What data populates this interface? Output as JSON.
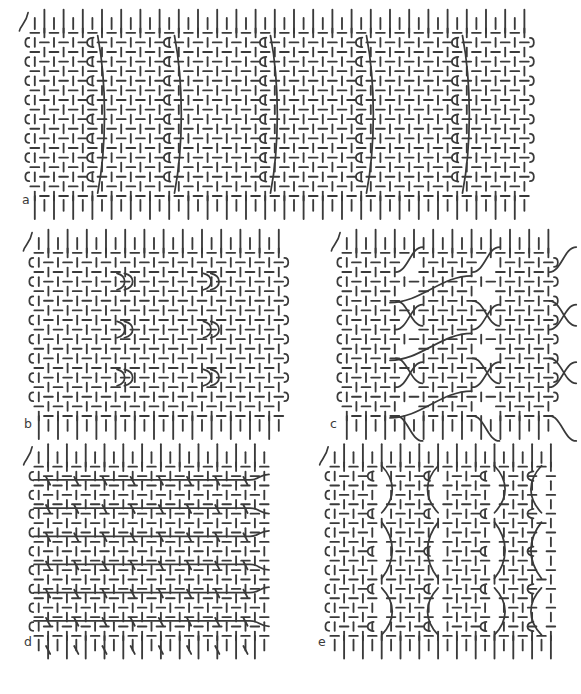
{
  "figure": {
    "kind": "weave-structure-diagram",
    "background_color": "#ffffff",
    "thread_color": "#3a3a3a",
    "label_color": "#3b3b3b",
    "panel_count": 5,
    "canvas": {
      "width": 581,
      "height": 694
    }
  },
  "panels": [
    {
      "id": "a",
      "label": "a",
      "label_x": 22,
      "label_y": 194,
      "x": 30,
      "y": 28,
      "width": 515,
      "height": 180,
      "cell": 9.6,
      "cols": 52,
      "rows": 18,
      "ground_weave": "plain",
      "feature": "supplementary-warp-loops",
      "feature_columns": [
        6,
        14,
        24,
        34,
        44
      ],
      "left_selvedge": "open-loops",
      "right_selvedge": "open-loops",
      "top_edge": "free-warp-ends",
      "bottom_edge": "free-warp-ends"
    },
    {
      "id": "b",
      "label": "b",
      "label_x": 24,
      "label_y": 418,
      "x": 34,
      "y": 248,
      "width": 252,
      "height": 180,
      "cell": 9.6,
      "cols": 26,
      "rows": 18,
      "ground_weave": "plain",
      "feature": "paired-weft-loops",
      "feature_columns": [
        9,
        18
      ],
      "feature_rows": [
        3,
        8,
        13
      ],
      "left_selvedge": "open-loops",
      "right_selvedge": "open-loops",
      "top_edge": "free-warp-ends",
      "bottom_edge": "free-warp-ends"
    },
    {
      "id": "c",
      "label": "c",
      "label_x": 330,
      "label_y": 418,
      "x": 342,
      "y": 248,
      "width": 210,
      "height": 180,
      "cell": 9.6,
      "cols": 22,
      "rows": 18,
      "ground_weave": "plain",
      "feature": "diagonal-floating-wefts",
      "block_columns": [
        0,
        8,
        16
      ],
      "float_rows": [
        2,
        5,
        8,
        11,
        14,
        17
      ],
      "left_selvedge": "open-loops",
      "right_selvedge": "open-loops",
      "top_edge": "free-warp-ends",
      "bottom_edge": "free-warp-ends"
    },
    {
      "id": "d",
      "label": "d",
      "label_x": 24,
      "label_y": 636,
      "x": 34,
      "y": 462,
      "width": 240,
      "height": 182,
      "cell": 9.4,
      "cols": 25,
      "rows": 19,
      "ground_weave": "plain",
      "feature": "undulating-wavy-wefts",
      "wave_rows": [
        1,
        4,
        7,
        10,
        13,
        16
      ],
      "wave_period": 48,
      "wave_amplitude": 9,
      "left_selvedge": "open-loops",
      "right_selvedge": "open-ends",
      "top_edge": "free-warp-ends",
      "bottom_edge": "free-warp-ends"
    },
    {
      "id": "e",
      "label": "e",
      "label_x": 318,
      "label_y": 636,
      "x": 330,
      "y": 462,
      "width": 228,
      "height": 182,
      "cell": 9.4,
      "cols": 24,
      "rows": 19,
      "ground_weave": "plain",
      "feature": "vertical-floating-warps",
      "float_columns": [
        5,
        11,
        17,
        22
      ],
      "float_row_groups": [
        [
          0,
          5
        ],
        [
          6,
          12
        ],
        [
          13,
          18
        ]
      ],
      "left_selvedge": "open-loops",
      "right_selvedge": "open-ends",
      "top_edge": "free-warp-ends",
      "bottom_edge": "free-warp-ends"
    }
  ]
}
